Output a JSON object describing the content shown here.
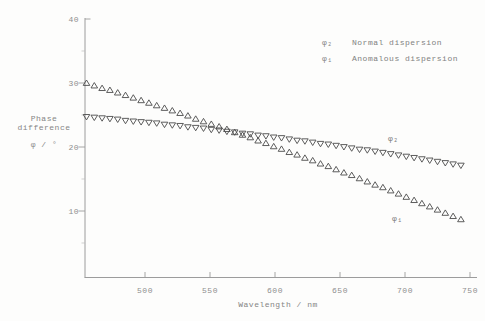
{
  "figure": {
    "background": "#fdfdfc",
    "axis_color": "#9c9c9c",
    "tick_label_color": "#8f8f8f",
    "text_color": "#858585",
    "marker_color": "#4b4b4b"
  },
  "chart_data": {
    "type": "scatter",
    "title": "",
    "xlabel": "Wavelength / nm",
    "ylabel_lines": [
      "Phase",
      "difference",
      "φ / °"
    ],
    "xlim": [
      455,
      757
    ],
    "ylim": [
      0,
      40
    ],
    "x_ticks": [
      500,
      550,
      600,
      650,
      700,
      750
    ],
    "y_ticks": [
      10,
      20,
      30,
      40
    ],
    "y_minor_ticks": [
      5,
      15,
      25,
      35
    ],
    "grid": false,
    "legend_position": "top-right",
    "x": [
      455,
      461,
      467,
      473,
      479,
      485,
      491,
      497,
      503,
      509,
      515,
      521,
      527,
      533,
      539,
      545,
      551,
      557,
      563,
      569,
      575,
      581,
      587,
      593,
      599,
      605,
      611,
      617,
      623,
      629,
      635,
      641,
      647,
      653,
      659,
      665,
      671,
      677,
      683,
      689,
      695,
      701,
      707,
      713,
      719,
      725,
      731,
      737,
      743
    ],
    "series": [
      {
        "name": "φ₁",
        "legend_label": "Anomalous dispersion",
        "marker": "triangle-up",
        "values": [
          30.0,
          29.6,
          29.2,
          28.9,
          28.5,
          28.1,
          27.7,
          27.3,
          26.9,
          26.5,
          26.1,
          25.7,
          25.3,
          24.9,
          24.4,
          24.0,
          23.6,
          23.2,
          22.8,
          22.3,
          21.9,
          21.5,
          21.0,
          20.6,
          20.1,
          19.7,
          19.2,
          18.8,
          18.3,
          17.9,
          17.4,
          17.0,
          16.5,
          16.0,
          15.6,
          15.1,
          14.6,
          14.1,
          13.7,
          13.2,
          12.7,
          12.2,
          11.7,
          11.2,
          10.7,
          10.2,
          9.7,
          9.2,
          8.7
        ]
      },
      {
        "name": "φ₂",
        "legend_label": "Normal dispersion",
        "marker": "triangle-down",
        "values": [
          24.7,
          24.6,
          24.5,
          24.4,
          24.3,
          24.1,
          24.0,
          23.9,
          23.8,
          23.7,
          23.5,
          23.4,
          23.3,
          23.1,
          23.0,
          22.9,
          22.7,
          22.6,
          22.4,
          22.3,
          22.1,
          22.0,
          21.8,
          21.7,
          21.5,
          21.4,
          21.2,
          21.0,
          20.9,
          20.7,
          20.5,
          20.4,
          20.2,
          20.0,
          19.8,
          19.6,
          19.5,
          19.3,
          19.1,
          18.9,
          18.7,
          18.5,
          18.3,
          18.1,
          17.9,
          17.7,
          17.5,
          17.3,
          17.1
        ]
      }
    ],
    "annotations": [
      {
        "text": "φ₂",
        "x": 691,
        "y": 21.4
      },
      {
        "text": "φ₁",
        "x": 694,
        "y": 8.9
      }
    ]
  },
  "legend": {
    "entries": [
      {
        "symbol": "φ₂",
        "label": "Normal dispersion"
      },
      {
        "symbol": "φ₁",
        "label": "Anomalous dispersion"
      }
    ]
  }
}
